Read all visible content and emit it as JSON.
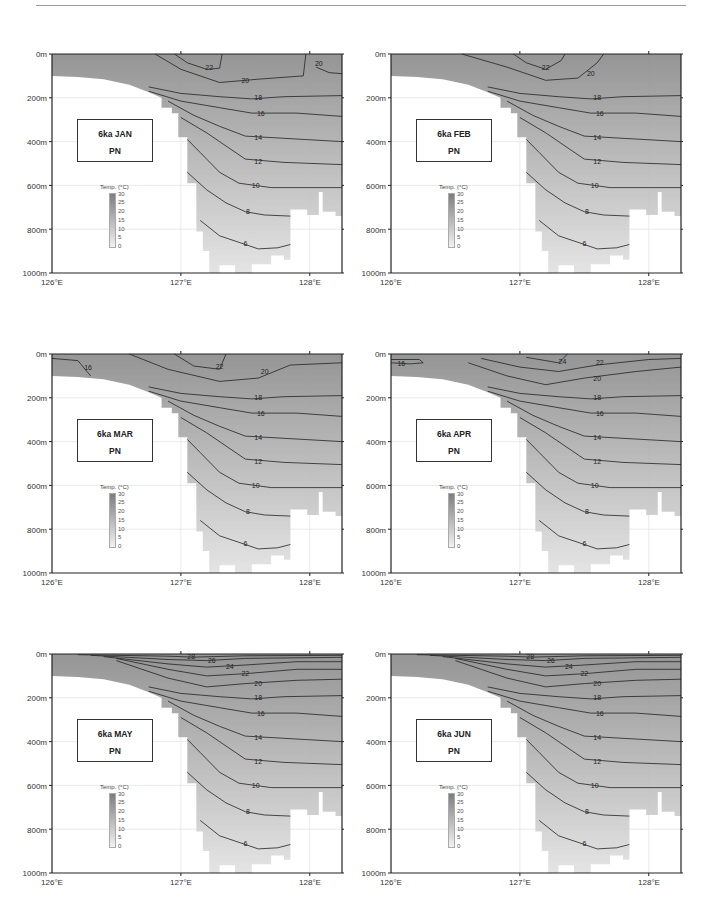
{
  "page": {
    "background": "#ffffff",
    "rule_color": "#9a9a9a"
  },
  "chart_data": [
    {
      "type": "heatmap",
      "subtype": "vertical temperature section with contours",
      "title": "6ka JAN",
      "subtitle": "PN",
      "xlabel": "",
      "ylabel": "",
      "x_ticks": [
        "126°E",
        "127°E",
        "128°E"
      ],
      "y_ticks": [
        "0m",
        "200m",
        "400m",
        "600m",
        "800m",
        "1000m"
      ],
      "xlim": [
        126,
        128.25
      ],
      "ylim": [
        0,
        1000
      ],
      "colorbar": {
        "title": "Temp. (°C)",
        "ticks": [
          0,
          5,
          10,
          15,
          20,
          25,
          30
        ],
        "range": [
          0,
          30
        ]
      },
      "contour_labels": [
        22,
        20,
        20,
        18,
        16,
        14,
        12,
        10,
        8,
        8,
        6
      ],
      "contour_levels": [
        6,
        8,
        10,
        12,
        14,
        16,
        18,
        20,
        22
      ]
    },
    {
      "type": "heatmap",
      "subtype": "vertical temperature section with contours",
      "title": "6ka FEB",
      "subtitle": "PN",
      "x_ticks": [
        "126°E",
        "127°E",
        "128°E"
      ],
      "y_ticks": [
        "0m",
        "200m",
        "400m",
        "600m",
        "800m",
        "1000m"
      ],
      "xlim": [
        126,
        128.25
      ],
      "ylim": [
        0,
        1000
      ],
      "colorbar": {
        "title": "Temp. (°C)",
        "ticks": [
          0,
          5,
          10,
          15,
          20,
          25,
          30
        ],
        "range": [
          0,
          30
        ]
      },
      "contour_labels": [
        22,
        20,
        18,
        16,
        14,
        12,
        10,
        8,
        8,
        6
      ],
      "contour_levels": [
        6,
        8,
        10,
        12,
        14,
        16,
        18,
        20,
        22
      ]
    },
    {
      "type": "heatmap",
      "subtype": "vertical temperature section with contours",
      "title": "6ka MAR",
      "subtitle": "PN",
      "x_ticks": [
        "126°E",
        "127°E",
        "128°E"
      ],
      "y_ticks": [
        "0m",
        "200m",
        "400m",
        "600m",
        "800m",
        "1000m"
      ],
      "xlim": [
        126,
        128.25
      ],
      "ylim": [
        0,
        1000
      ],
      "colorbar": {
        "title": "Temp. (°C)",
        "ticks": [
          0,
          5,
          10,
          15,
          20,
          25,
          30
        ],
        "range": [
          0,
          30
        ]
      },
      "contour_labels": [
        16,
        22,
        20,
        18,
        16,
        14,
        12,
        10,
        8,
        8,
        6
      ],
      "contour_levels": [
        6,
        8,
        10,
        12,
        14,
        16,
        18,
        20,
        22
      ]
    },
    {
      "type": "heatmap",
      "subtype": "vertical temperature section with contours",
      "title": "6ka APR",
      "subtitle": "PN",
      "x_ticks": [
        "126°E",
        "127°E",
        "128°E"
      ],
      "y_ticks": [
        "0m",
        "200m",
        "400m",
        "600m",
        "800m",
        "1000m"
      ],
      "xlim": [
        126,
        128.25
      ],
      "ylim": [
        0,
        1000
      ],
      "colorbar": {
        "title": "Temp. (°C)",
        "ticks": [
          0,
          5,
          10,
          15,
          20,
          25,
          30
        ],
        "range": [
          0,
          30
        ]
      },
      "contour_labels": [
        16,
        24,
        22,
        20,
        18,
        16,
        14,
        12,
        10,
        8,
        8,
        6
      ],
      "contour_levels": [
        6,
        8,
        10,
        12,
        14,
        16,
        18,
        20,
        22,
        24
      ]
    },
    {
      "type": "heatmap",
      "subtype": "vertical temperature section with contours",
      "title": "6ka MAY",
      "subtitle": "PN",
      "x_ticks": [
        "126°E",
        "127°E",
        "128°E"
      ],
      "y_ticks": [
        "0m",
        "200m",
        "400m",
        "600m",
        "800m",
        "1000m"
      ],
      "xlim": [
        126,
        128.25
      ],
      "ylim": [
        0,
        1000
      ],
      "colorbar": {
        "title": "Temp. (°C)",
        "ticks": [
          0,
          5,
          10,
          15,
          20,
          25,
          30
        ],
        "range": [
          0,
          30
        ]
      },
      "contour_labels": [
        28,
        26,
        24,
        22,
        20,
        18,
        16,
        14,
        12,
        10,
        8,
        8,
        6
      ],
      "contour_levels": [
        6,
        8,
        10,
        12,
        14,
        16,
        18,
        20,
        22,
        24,
        26,
        28
      ]
    },
    {
      "type": "heatmap",
      "subtype": "vertical temperature section with contours",
      "title": "6ka JUN",
      "subtitle": "PN",
      "x_ticks": [
        "126°E",
        "127°E",
        "128°E"
      ],
      "y_ticks": [
        "0m",
        "200m",
        "400m",
        "600m",
        "800m",
        "1000m"
      ],
      "xlim": [
        126,
        128.25
      ],
      "ylim": [
        0,
        1000
      ],
      "colorbar": {
        "title": "Temp. (°C)",
        "ticks": [
          0,
          5,
          10,
          15,
          20,
          25,
          30
        ],
        "range": [
          0,
          30
        ]
      },
      "contour_labels": [
        28,
        26,
        24,
        22,
        20,
        18,
        16,
        14,
        12,
        10,
        8,
        8,
        6
      ],
      "contour_levels": [
        6,
        8,
        10,
        12,
        14,
        16,
        18,
        20,
        22,
        24,
        26,
        28
      ]
    }
  ],
  "panels": [
    {
      "id": "jan",
      "title": "6ka JAN",
      "subtitle": "PN",
      "left": 0,
      "top": 45
    },
    {
      "id": "feb",
      "title": "6ka FEB",
      "subtitle": "PN",
      "left": 339,
      "top": 45
    },
    {
      "id": "mar",
      "title": "6ka MAR",
      "subtitle": "PN",
      "left": 0,
      "top": 345
    },
    {
      "id": "apr",
      "title": "6ka APR",
      "subtitle": "PN",
      "left": 339,
      "top": 345
    },
    {
      "id": "may",
      "title": "6ka MAY",
      "subtitle": "PN",
      "left": 0,
      "top": 645
    },
    {
      "id": "jun",
      "title": "6ka JUN",
      "subtitle": "PN",
      "left": 339,
      "top": 645
    }
  ],
  "axes": {
    "y_ticks": [
      "0m",
      "200m",
      "400m",
      "600m",
      "800m",
      "1000m"
    ],
    "x_ticks": [
      "126°E",
      "127°E",
      "128°E"
    ]
  },
  "colorbar": {
    "title": "Temp. (°C)",
    "ticks": [
      "30",
      "25",
      "20",
      "15",
      "10",
      "5",
      "0"
    ]
  },
  "colors": {
    "ocean_dark": "#8c8c8c",
    "ocean_light": "#e2e2e2",
    "land": "#ffffff",
    "contour": "#222222",
    "frame": "#222222"
  }
}
